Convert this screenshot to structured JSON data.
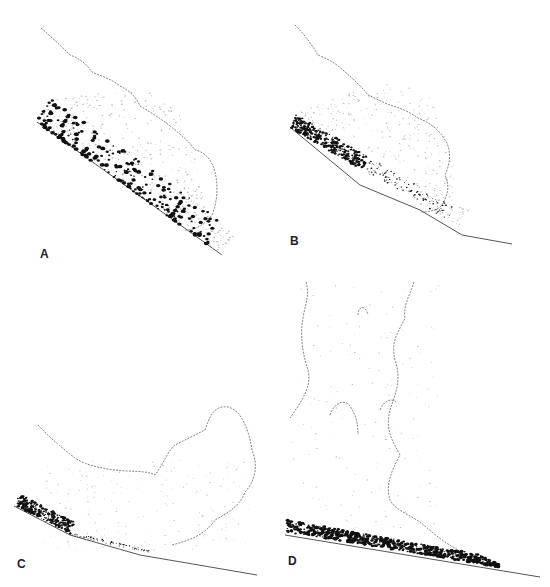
{
  "figure": {
    "panels": [
      {
        "id": "A",
        "label": "A",
        "stage": "Dense flow with coarse clasts dispersed through the lower part of the current"
      },
      {
        "id": "B",
        "label": "B",
        "stage": "Coarse clasts segregated into a basal layer at the rear of the current"
      },
      {
        "id": "C",
        "label": "C",
        "stage": "Current decelerating on gentler slope; basal deposit accumulating; dilute cloud lofting"
      },
      {
        "id": "D",
        "label": "D",
        "stage": "Buoyant plume rising (lift-off) above a coarse basal deposit"
      }
    ]
  },
  "colors": {
    "background": "#ffffff",
    "outline": "#666666",
    "ground": "#555555",
    "coarse_clasts": "#111111",
    "fine_particles": "#bbbbbb"
  }
}
